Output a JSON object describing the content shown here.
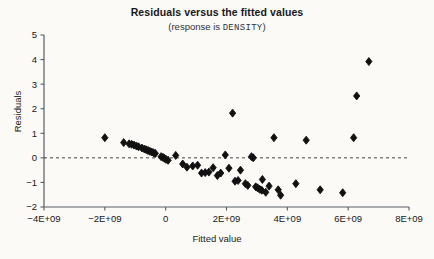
{
  "chart_data": {
    "type": "scatter",
    "title": "Residuals versus the fitted values",
    "subtitle_prefix": "(response is ",
    "subtitle_variable": "DENSITY",
    "subtitle_suffix": ")",
    "xlabel": "Fitted value",
    "ylabel": "Residuals",
    "xlim": [
      -4000000000,
      8000000000
    ],
    "ylim": [
      -2,
      5
    ],
    "xticks": [
      -4000000000,
      -2000000000,
      0,
      2000000000,
      4000000000,
      6000000000,
      8000000000
    ],
    "xtick_labels": [
      "-4E+09",
      "-2E+09",
      "0",
      "2E+09",
      "4E+09",
      "6E+09",
      "8E+09"
    ],
    "yticks": [
      -2,
      -1,
      0,
      1,
      2,
      3,
      4,
      5
    ],
    "ytick_labels": [
      "-2",
      "-1",
      "0",
      "1",
      "2",
      "3",
      "4",
      "5"
    ],
    "grid": false,
    "legend": false,
    "reference_line": {
      "orientation": "horizontal",
      "y": 0,
      "style": "dashed",
      "color": "#444444"
    },
    "marker": {
      "shape": "diamond",
      "color": "#111111",
      "size": 4
    },
    "points": [
      {
        "x": -2000000000,
        "y": 0.82
      },
      {
        "x": -1380000000,
        "y": 0.62
      },
      {
        "x": -1200000000,
        "y": 0.57
      },
      {
        "x": -1120000000,
        "y": 0.55
      },
      {
        "x": -1040000000,
        "y": 0.52
      },
      {
        "x": -960000000,
        "y": 0.48
      },
      {
        "x": -890000000,
        "y": 0.45
      },
      {
        "x": -780000000,
        "y": 0.4
      },
      {
        "x": -700000000,
        "y": 0.36
      },
      {
        "x": -640000000,
        "y": 0.33
      },
      {
        "x": -580000000,
        "y": 0.3
      },
      {
        "x": -520000000,
        "y": 0.27
      },
      {
        "x": -460000000,
        "y": 0.24
      },
      {
        "x": -400000000,
        "y": 0.21
      },
      {
        "x": -340000000,
        "y": 0.18
      },
      {
        "x": -150000000,
        "y": 0.05
      },
      {
        "x": -90000000,
        "y": 0.02
      },
      {
        "x": -40000000,
        "y": -0.02
      },
      {
        "x": 10000000,
        "y": -0.06
      },
      {
        "x": 80000000,
        "y": -0.1
      },
      {
        "x": 330000000,
        "y": 0.1
      },
      {
        "x": 560000000,
        "y": -0.25
      },
      {
        "x": 700000000,
        "y": -0.38
      },
      {
        "x": 890000000,
        "y": -0.33
      },
      {
        "x": 1050000000,
        "y": -0.3
      },
      {
        "x": 1180000000,
        "y": -0.62
      },
      {
        "x": 1300000000,
        "y": -0.6
      },
      {
        "x": 1420000000,
        "y": -0.58
      },
      {
        "x": 1560000000,
        "y": -0.4
      },
      {
        "x": 1700000000,
        "y": -0.72
      },
      {
        "x": 1810000000,
        "y": -0.62
      },
      {
        "x": 1960000000,
        "y": 0.12
      },
      {
        "x": 2080000000,
        "y": -0.42
      },
      {
        "x": 2200000000,
        "y": 1.82
      },
      {
        "x": 2280000000,
        "y": -0.95
      },
      {
        "x": 2380000000,
        "y": -0.92
      },
      {
        "x": 2460000000,
        "y": -0.5
      },
      {
        "x": 2620000000,
        "y": -1.05
      },
      {
        "x": 2700000000,
        "y": -1.12
      },
      {
        "x": 2820000000,
        "y": 0.05
      },
      {
        "x": 2880000000,
        "y": 0.0
      },
      {
        "x": 2960000000,
        "y": -1.18
      },
      {
        "x": 3020000000,
        "y": -1.22
      },
      {
        "x": 3090000000,
        "y": -1.28
      },
      {
        "x": 3160000000,
        "y": -1.32
      },
      {
        "x": 3180000000,
        "y": -0.88
      },
      {
        "x": 3290000000,
        "y": -1.4
      },
      {
        "x": 3400000000,
        "y": -1.15
      },
      {
        "x": 3560000000,
        "y": 0.82
      },
      {
        "x": 3700000000,
        "y": -1.3
      },
      {
        "x": 3780000000,
        "y": -1.52
      },
      {
        "x": 4280000000,
        "y": -1.05
      },
      {
        "x": 4620000000,
        "y": 0.72
      },
      {
        "x": 5080000000,
        "y": -1.3
      },
      {
        "x": 5820000000,
        "y": -1.42
      },
      {
        "x": 6180000000,
        "y": 0.82
      },
      {
        "x": 6280000000,
        "y": 2.52
      },
      {
        "x": 6680000000,
        "y": 3.92
      }
    ]
  }
}
